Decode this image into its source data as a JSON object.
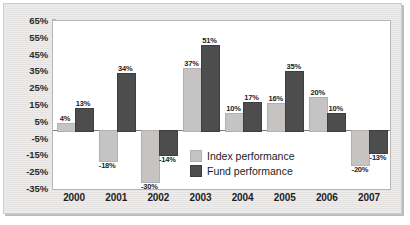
{
  "chart_data": {
    "type": "bar",
    "title": "",
    "subtitle": "",
    "xlabel": "",
    "ylabel": "",
    "categories": [
      "2000",
      "2001",
      "2002",
      "2003",
      "2004",
      "2005",
      "2006",
      "2007"
    ],
    "series": [
      {
        "name": "Index performance",
        "color": "#c6c4c2",
        "values": [
          4,
          -18,
          -30,
          37,
          10,
          16,
          20,
          -20
        ],
        "labels": [
          "4%",
          "-18%",
          "-30%",
          "37%",
          "10%",
          "16%",
          "20%",
          "-20%"
        ]
      },
      {
        "name": "Fund performance",
        "color": "#4d4d4d",
        "values": [
          13,
          34,
          -14,
          51,
          17,
          35,
          10,
          -13
        ],
        "labels": [
          "13%",
          "34%",
          "-14%",
          "51%",
          "17%",
          "35%",
          "10%",
          "-13%"
        ]
      }
    ],
    "ylim": [
      -35,
      65
    ],
    "ytick_values": [
      65,
      55,
      45,
      35,
      25,
      15,
      5,
      -5,
      -15,
      -25,
      -35
    ],
    "ytick_labels": [
      "65%",
      "55%",
      "45%",
      "35%",
      "25%",
      "15%",
      "5%",
      "-5%",
      "-15%",
      "-25%",
      "-35%"
    ],
    "grid": false,
    "legend_position": "inside-center-lower",
    "units": "percent"
  },
  "legend": {
    "items": [
      {
        "label": "Index performance",
        "swatch": "index"
      },
      {
        "label": "Fund performance",
        "swatch": "fund"
      }
    ]
  },
  "colors": {
    "index_bar": "#c6c4c2",
    "fund_bar": "#4d4d4d",
    "panel_background": "#e9e7e5",
    "plot_background": "#ffffff",
    "axis_line": "#7d7b79"
  }
}
